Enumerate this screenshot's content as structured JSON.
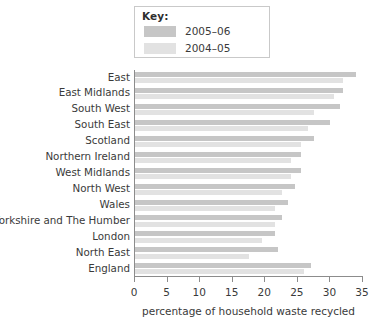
{
  "legend": {
    "title": "Key:",
    "entries": [
      {
        "label": "2005–06",
        "color": "#c6c6c6"
      },
      {
        "label": "2004–05",
        "color": "#e2e2e2"
      }
    ]
  },
  "axis": {
    "x_title": "percentage of household waste recycled",
    "ticks": [
      0,
      5,
      10,
      15,
      20,
      25,
      30,
      35
    ]
  },
  "chart_data": {
    "type": "bar",
    "orientation": "horizontal",
    "title": "",
    "xlabel": "percentage of household waste recycled",
    "ylabel": "",
    "xlim": [
      0,
      35
    ],
    "xticks": [
      0,
      5,
      10,
      15,
      20,
      25,
      30,
      35
    ],
    "grid": false,
    "legend_position": "top-left",
    "categories": [
      "East",
      "East Midlands",
      "South West",
      "South East",
      "Scotland",
      "Northern Ireland",
      "West Midlands",
      "North West",
      "Wales",
      "Yorkshire and The Humber",
      "London",
      "North East",
      "England"
    ],
    "series": [
      {
        "name": "2005–06",
        "color": "#c6c6c6",
        "values": [
          34.0,
          32.0,
          31.5,
          30.0,
          27.5,
          25.5,
          25.5,
          24.5,
          23.5,
          22.5,
          21.5,
          22.0,
          27.0
        ]
      },
      {
        "name": "2004–05",
        "color": "#e2e2e2",
        "values": [
          32.0,
          30.5,
          27.5,
          26.5,
          25.5,
          24.0,
          24.0,
          22.5,
          21.5,
          21.5,
          19.5,
          17.5,
          26.0
        ]
      }
    ]
  }
}
